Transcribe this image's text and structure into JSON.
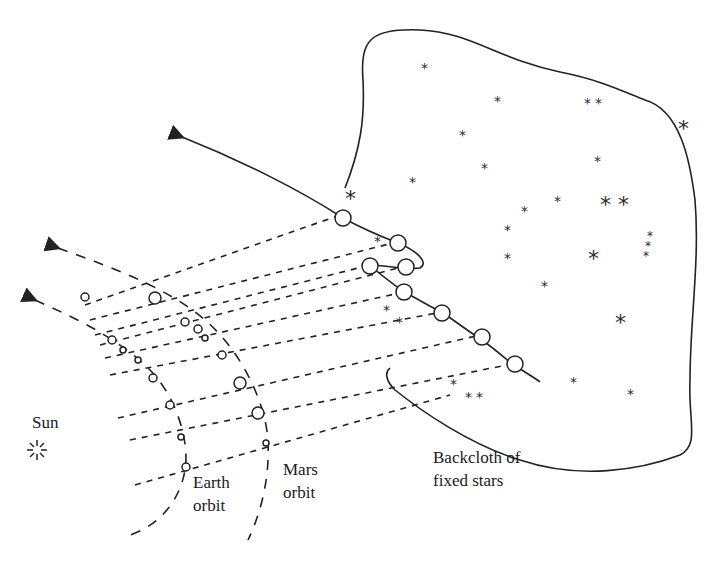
{
  "diagram": {
    "labels": {
      "sun": "Sun",
      "earth_orbit_line1": "Earth",
      "earth_orbit_line2": "orbit",
      "mars_orbit_line1": "Mars",
      "mars_orbit_line2": "orbit",
      "backcloth_line1": "Backcloth of",
      "backcloth_line2": "fixed stars"
    },
    "icons": {
      "sun": "sun-burst-icon",
      "star": "asterisk-star-icon"
    },
    "star_glyph": "*",
    "colors": {
      "ink": "#222222",
      "background": "#ffffff"
    }
  }
}
